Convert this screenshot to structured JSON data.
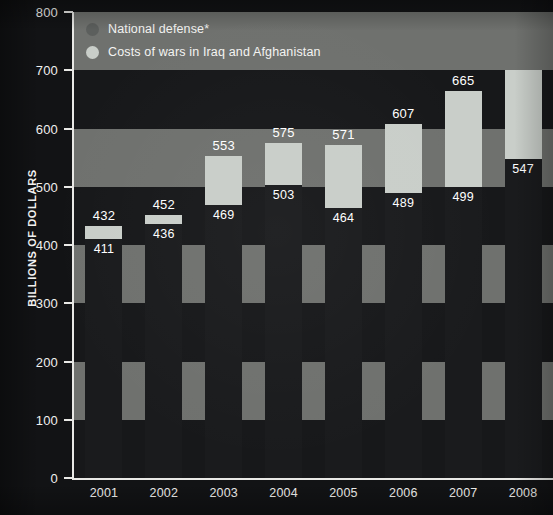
{
  "chart_data": {
    "type": "bar",
    "stacked": true,
    "title": "",
    "xlabel": "",
    "ylabel": "BILLIONS OF DOLLARS",
    "ylim": [
      0,
      800
    ],
    "ytick_step": 100,
    "yticks": [
      "0",
      "100",
      "200",
      "300",
      "400",
      "500",
      "600",
      "700",
      "800"
    ],
    "grid": false,
    "background_bands": true,
    "legend_position": "top-left",
    "categories": [
      "2001",
      "2002",
      "2003",
      "2004",
      "2005",
      "2006",
      "2007",
      "2008"
    ],
    "series": [
      {
        "name": "National defense*",
        "color": "#1a1b1d",
        "values": [
          411,
          436,
          469,
          503,
          464,
          489,
          499,
          547
        ]
      },
      {
        "name": "Costs of wars in Iraq and Afghanistan",
        "color": "#c9cec9",
        "values": [
          21,
          16,
          84,
          72,
          107,
          118,
          166,
          174
        ]
      }
    ],
    "totals": [
      432,
      452,
      553,
      575,
      571,
      607,
      665,
      721
    ],
    "total_labels": [
      "432",
      "452",
      "553",
      "575",
      "571",
      "607",
      "665",
      "721"
    ],
    "base_labels": [
      "411",
      "436",
      "469",
      "503",
      "464",
      "489",
      "499",
      "547"
    ]
  },
  "legend": {
    "items": [
      {
        "label": "National defense*",
        "swatch": "legend-swatch-defense"
      },
      {
        "label": "Costs of wars in Iraq and Afghanistan",
        "swatch": "legend-swatch-war"
      }
    ]
  },
  "axis": {
    "y_title": "BILLIONS OF DOLLARS"
  },
  "colors": {
    "defense_bar": "#1a1b1d",
    "war_bar": "#c9cec9",
    "band_light": "#6f716e",
    "band_dark": "#17181a",
    "axis_line": "#e9e9e6",
    "text": "#ffffff",
    "page_background": "#121315"
  }
}
